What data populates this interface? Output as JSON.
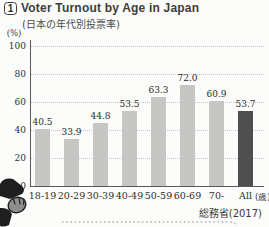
{
  "header": {
    "badge": "1",
    "title": "Voter Turnout by Age in Japan",
    "subtitle": "(日本の年代別投票率)"
  },
  "chart_data": {
    "type": "bar",
    "categories": [
      "18-19",
      "20-29",
      "30-39",
      "40-49",
      "50-59",
      "60-69",
      "70-",
      "All"
    ],
    "values": [
      40.5,
      33.9,
      44.8,
      53.5,
      63.3,
      72.0,
      60.9,
      53.7
    ],
    "value_labels": [
      "40.5",
      "33.9",
      "44.8",
      "53.5",
      "63.3",
      "72.0",
      "60.9",
      "53.7"
    ],
    "title": "Voter Turnout by Age in Japan",
    "subtitle": "(日本の年代別投票率)",
    "xlabel": "",
    "ylabel": "(%)",
    "x_unit": "(歳)",
    "ylim": [
      0,
      100
    ],
    "yticks": [
      0,
      20,
      40,
      60,
      80,
      100
    ],
    "grid": "horizontal-dotted",
    "legend": "none",
    "bar_color": "#c6c7c4",
    "highlight_index": 7,
    "highlight_color": "#4f4f4f",
    "source": "総務省(2017)"
  },
  "decorations": {
    "mascot": "person-figure-illustration",
    "divider": "dotted-separator-line"
  },
  "colors": {
    "background": "#fcfcfa",
    "axis": "#5a5a5a",
    "gridline": "#c6c6c6",
    "text": "#2f2f2f"
  }
}
